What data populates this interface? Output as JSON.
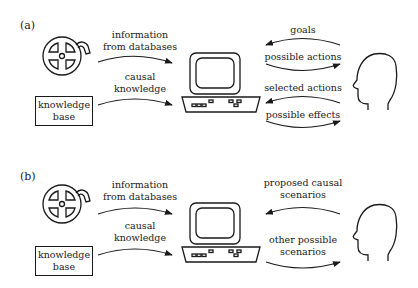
{
  "figure": {
    "panels": [
      {
        "label": "(a)",
        "database_icon": "film-reel-icon",
        "knowledge_base": {
          "line1": "knowledge",
          "line2": "base"
        },
        "left_arrows": [
          {
            "line1": "information",
            "line2": "from databases",
            "direction": "to-computer"
          },
          {
            "line1": "causal",
            "line2": "knowledge",
            "direction": "to-computer"
          }
        ],
        "computer_icon": "computer-icon",
        "right_arrows": [
          {
            "text": "goals",
            "direction": "to-computer"
          },
          {
            "text": "possible actions",
            "direction": "to-person"
          },
          {
            "text": "selected actions",
            "direction": "to-computer"
          },
          {
            "text": "possible effects",
            "direction": "to-person"
          }
        ],
        "person_icon": "human-head-icon"
      },
      {
        "label": "(b)",
        "database_icon": "film-reel-icon",
        "knowledge_base": {
          "line1": "knowledge",
          "line2": "base"
        },
        "left_arrows": [
          {
            "line1": "information",
            "line2": "from databases",
            "direction": "to-computer"
          },
          {
            "line1": "causal",
            "line2": "knowledge",
            "direction": "to-computer"
          }
        ],
        "computer_icon": "computer-icon",
        "right_arrows": [
          {
            "line1": "proposed causal",
            "line2": "scenarios",
            "direction": "to-computer"
          },
          {
            "line1": "other possible",
            "line2": "scenarios",
            "direction": "to-person"
          }
        ],
        "person_icon": "human-head-icon"
      }
    ]
  }
}
